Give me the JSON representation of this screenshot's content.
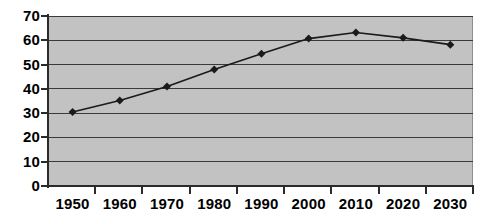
{
  "chart_data": {
    "type": "line",
    "title": "",
    "subtitle": "",
    "xlabel": "",
    "ylabel": "",
    "categories": [
      "1950",
      "1960",
      "1970",
      "1980",
      "1990",
      "2000",
      "2010",
      "2020",
      "2030"
    ],
    "values": [
      30.5,
      35.2,
      41.0,
      48.0,
      54.5,
      60.7,
      63.2,
      61.0,
      58.2
    ],
    "series": [
      {
        "name": "",
        "values": [
          30.5,
          35.2,
          41.0,
          48.0,
          54.5,
          60.7,
          63.2,
          61.0,
          58.2
        ]
      }
    ],
    "ylim": [
      0,
      70
    ],
    "yticks": [
      0,
      10,
      20,
      30,
      40,
      50,
      60,
      70
    ],
    "ytick_labels": [
      "0",
      "10",
      "20",
      "30",
      "40",
      "50",
      "60",
      "70"
    ],
    "xtick_labels": [
      "1950",
      "1960",
      "1970",
      "1980",
      "1990",
      "2000",
      "2010",
      "2020",
      "2030"
    ],
    "grid": true,
    "grid_axis": "y",
    "legend": false,
    "legend_position": "none",
    "marker": "diamond",
    "line_color": "#1a1a1a",
    "marker_color": "#1a1a1a",
    "plot_background": "#c2c2c2",
    "figure_background": "#ffffff",
    "gridline_color": "#3a3a3a",
    "axis_color": "#2b2b2b"
  },
  "axes": {
    "y_tick_labels": [
      "70",
      "60",
      "50",
      "40",
      "30",
      "20",
      "10",
      "0"
    ],
    "x_tick_labels": [
      "1950",
      "1960",
      "1970",
      "1980",
      "1990",
      "2000",
      "2010",
      "2020",
      "2030"
    ]
  }
}
